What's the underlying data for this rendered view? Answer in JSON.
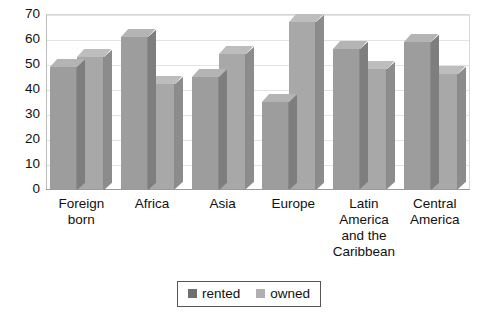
{
  "chart_data": {
    "type": "bar",
    "title": "",
    "xlabel": "",
    "ylabel": "",
    "ylim": [
      0,
      70
    ],
    "yticks": [
      70,
      60,
      50,
      40,
      30,
      20,
      10,
      0
    ],
    "grid": true,
    "legend_position": "bottom",
    "categories": [
      "Foreign born",
      "Africa",
      "Asia",
      "Europe",
      "Latin America and the Caribbean",
      "Central America"
    ],
    "category_lines": [
      [
        "Foreign",
        "born"
      ],
      [
        "Africa"
      ],
      [
        "Asia"
      ],
      [
        "Europe"
      ],
      [
        "Latin",
        "America",
        "and the",
        "Caribbean"
      ],
      [
        "Central",
        "America"
      ]
    ],
    "series": [
      {
        "name": "rented",
        "color": "#9d9d9d",
        "values": [
          49,
          61,
          45,
          35,
          56,
          59
        ]
      },
      {
        "name": "owned",
        "color": "#a8a8a8",
        "values": [
          53,
          42,
          54,
          67,
          48,
          46
        ]
      }
    ]
  },
  "legend": {
    "items": [
      {
        "label": "rented",
        "swatch": "rented"
      },
      {
        "label": "owned",
        "swatch": "owned"
      }
    ]
  }
}
